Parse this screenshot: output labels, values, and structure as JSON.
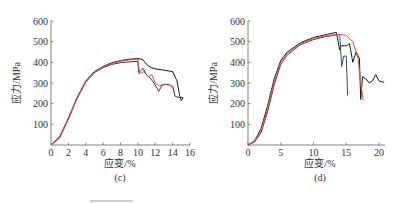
{
  "chart_data": [
    {
      "type": "line",
      "panel_label": "(c)",
      "xlabel": "应变/%",
      "ylabel": "应力/MPa",
      "xlim": [
        0,
        16
      ],
      "ylim": [
        0,
        600
      ],
      "xticks": [
        0,
        2,
        4,
        6,
        8,
        10,
        12,
        14,
        16
      ],
      "yticks": [
        100,
        200,
        300,
        400,
        500,
        600
      ],
      "grid": false,
      "series": [
        {
          "name": "curve-1",
          "color": "#1a1a1a",
          "x": [
            0,
            1,
            2,
            3,
            4,
            5,
            6,
            7,
            8,
            9,
            10,
            10.5,
            11,
            11.5,
            12,
            13,
            14,
            14.5,
            14.8,
            15,
            15.2
          ],
          "y": [
            0,
            40,
            130,
            230,
            310,
            355,
            380,
            398,
            408,
            415,
            418,
            415,
            390,
            375,
            368,
            362,
            355,
            310,
            240,
            215,
            230
          ]
        },
        {
          "name": "curve-2",
          "color": "#2b3a55",
          "x": [
            0,
            1,
            2,
            3,
            4,
            5,
            6,
            7,
            8,
            9,
            10,
            10.1,
            10.6,
            11,
            11.5,
            12,
            12.4,
            12.8,
            13.5,
            14,
            14.3,
            14.8,
            15.2
          ],
          "y": [
            0,
            35,
            125,
            225,
            305,
            350,
            375,
            390,
            398,
            402,
            405,
            350,
            370,
            340,
            320,
            290,
            260,
            290,
            295,
            280,
            235,
            230,
            230
          ]
        },
        {
          "name": "curve-3",
          "color": "#d9533f",
          "x": [
            0,
            1,
            2,
            3,
            4,
            5,
            6,
            7,
            8,
            9,
            10,
            10.2,
            10.7,
            11.2,
            11.6,
            12,
            12.5,
            13,
            13.5,
            14,
            14.2
          ],
          "y": [
            0,
            38,
            128,
            228,
            308,
            352,
            378,
            395,
            405,
            412,
            415,
            345,
            355,
            330,
            340,
            300,
            285,
            295,
            290,
            285,
            260
          ]
        }
      ]
    },
    {
      "type": "line",
      "panel_label": "(d)",
      "xlabel": "应变/%",
      "ylabel": "应力/MPa",
      "xlim": [
        0,
        21
      ],
      "ylim": [
        0,
        600
      ],
      "xticks": [
        0,
        5,
        10,
        15,
        20
      ],
      "yticks": [
        100,
        200,
        300,
        400,
        500,
        600
      ],
      "grid": false,
      "series": [
        {
          "name": "curve-1",
          "color": "#1a1a1a",
          "x": [
            0,
            1,
            2,
            3,
            4,
            5,
            6,
            8,
            10,
            12,
            13.5,
            14,
            14.2,
            15,
            15.5,
            16,
            16.5,
            17,
            17.2,
            17.5,
            18,
            18.5,
            19,
            19.5,
            20,
            20.5,
            20.8
          ],
          "y": [
            0,
            20,
            80,
            190,
            320,
            410,
            450,
            495,
            520,
            535,
            545,
            460,
            480,
            480,
            490,
            400,
            450,
            420,
            220,
            330,
            320,
            300,
            310,
            340,
            310,
            305,
            305
          ]
        },
        {
          "name": "curve-2",
          "color": "#3a4a6b",
          "x": [
            0,
            1,
            2,
            3,
            4,
            5,
            6,
            8,
            10,
            12,
            14,
            14.3,
            14.6,
            15,
            15.2
          ],
          "y": [
            0,
            15,
            60,
            160,
            290,
            390,
            435,
            485,
            510,
            525,
            535,
            380,
            430,
            430,
            240
          ]
        },
        {
          "name": "curve-3",
          "color": "#d9533f",
          "x": [
            0,
            1,
            2,
            3,
            4,
            5,
            6,
            8,
            10,
            12,
            14,
            15,
            16,
            16.8,
            17.2,
            17.6
          ],
          "y": [
            0,
            18,
            70,
            175,
            305,
            400,
            442,
            490,
            515,
            530,
            535,
            530,
            500,
            420,
            300,
            215
          ]
        }
      ]
    }
  ],
  "panels": {
    "c": {
      "label": "(c)",
      "xlabel": "应变/%",
      "ylabel": "应力/MPa"
    },
    "d": {
      "label": "(d)",
      "xlabel": "应变/%",
      "ylabel": "应力/MPa"
    }
  }
}
